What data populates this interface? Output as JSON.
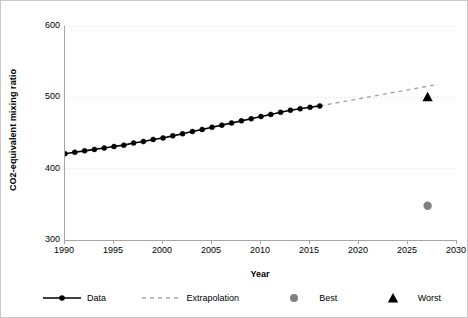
{
  "chart_data": {
    "type": "line",
    "title": "",
    "xlabel": "Year",
    "ylabel": "CO2-equivalent mixing ratio",
    "xlim": [
      1990,
      2030
    ],
    "ylim": [
      300,
      600
    ],
    "xticks": [
      1990,
      1995,
      2000,
      2005,
      2010,
      2015,
      2020,
      2025,
      2030
    ],
    "yticks": [
      300,
      400,
      500,
      600
    ],
    "grid": "horizontal-dotted",
    "legend_position": "bottom",
    "series": [
      {
        "name": "Data",
        "style": "solid-line-with-round-markers",
        "color": "#000000",
        "x": [
          1990,
          1991,
          1992,
          1993,
          1994,
          1995,
          1996,
          1997,
          1998,
          1999,
          2000,
          2001,
          2002,
          2003,
          2004,
          2005,
          2006,
          2007,
          2008,
          2009,
          2010,
          2011,
          2012,
          2013,
          2014,
          2015,
          2016
        ],
        "values": [
          421,
          423,
          425,
          427,
          429,
          431,
          433,
          436,
          438,
          441,
          443,
          446,
          449,
          452,
          455,
          458,
          461,
          464,
          467,
          470,
          473,
          476,
          479,
          482,
          484,
          486,
          488
        ]
      },
      {
        "name": "Extrapolation",
        "style": "dashed-line",
        "color": "#a6a6a6",
        "x": [
          2016,
          2028
        ],
        "values": [
          488,
          518
        ]
      },
      {
        "name": "Best",
        "style": "circle-marker",
        "color": "#808080",
        "x": [
          2027
        ],
        "values": [
          348
        ]
      },
      {
        "name": "Worst",
        "style": "triangle-marker",
        "color": "#000000",
        "x": [
          2027
        ],
        "values": [
          500
        ]
      }
    ]
  },
  "axes": {
    "ylabel_text": "CO2-equivalent mixing ratio",
    "xlabel_text": "Year",
    "ytick_labels": [
      "600",
      "500",
      "400",
      "300"
    ],
    "xtick_labels": [
      "1990",
      "1995",
      "2000",
      "2005",
      "2010",
      "2015",
      "2020",
      "2025",
      "2030"
    ]
  },
  "legend": {
    "items": [
      {
        "label": "Data",
        "key": "line-marker-key",
        "color": "#000000"
      },
      {
        "label": "Extrapolation",
        "key": "dashed-line-key",
        "color": "#a6a6a6"
      },
      {
        "label": "Best",
        "key": "circle-key",
        "color": "#808080"
      },
      {
        "label": "Worst",
        "key": "triangle-key",
        "color": "#000000"
      }
    ]
  },
  "colors": {
    "data": "#000000",
    "extrapolation": "#a6a6a6",
    "best": "#808080",
    "worst": "#000000",
    "axis": "#a6a6a6",
    "grid": "#d9d9d9",
    "frame": "#c9c9c9"
  }
}
